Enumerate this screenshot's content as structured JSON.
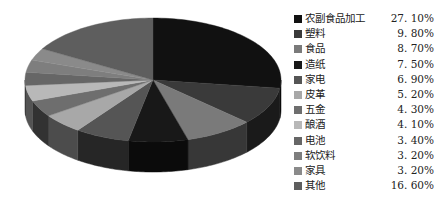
{
  "chart_data": {
    "type": "pie",
    "style": "3d",
    "title": "",
    "legend_position": "right",
    "start_angle": "12 o'clock",
    "direction": "clockwise",
    "categories": [
      "农副食品加工",
      "塑料",
      "食品",
      "造纸",
      "家电",
      "皮革",
      "五金",
      "酿酒",
      "电池",
      "软饮料",
      "家具",
      "其他"
    ],
    "values": [
      27.1,
      9.8,
      8.7,
      7.5,
      6.9,
      5.2,
      4.3,
      4.1,
      3.4,
      3.2,
      3.2,
      16.6
    ],
    "value_labels": [
      "27.10%",
      "9.80%",
      "8.70%",
      "7.50%",
      "6.90%",
      "5.20%",
      "4.30%",
      "4.10%",
      "3.40%",
      "3.20%",
      "3.20%",
      "16.60%"
    ],
    "colors": [
      "#111111",
      "#3a3a3a",
      "#7a7a7a",
      "#181818",
      "#555555",
      "#a8a8a8",
      "#6e6e6e",
      "#b8b8b8",
      "#666666",
      "#7e7e7e",
      "#8a8a8a",
      "#5e5e5e"
    ]
  }
}
